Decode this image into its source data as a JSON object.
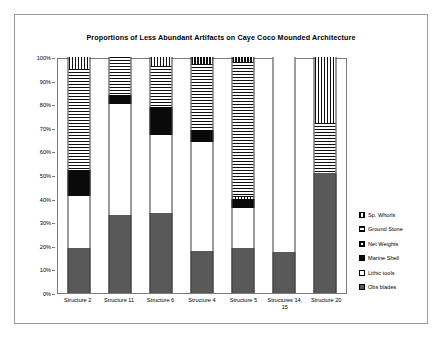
{
  "frame": {
    "border_color": "#9a9a9a"
  },
  "chart_data": {
    "type": "bar",
    "subtype": "stacked-100-percent",
    "title": "Proportions of Less Abundant Artifacts on Caye Coco Mounded Architecture",
    "xlabel": "",
    "ylabel": "",
    "ylim": [
      0,
      100
    ],
    "ytick_labels": [
      "100%",
      "90%",
      "80%",
      "70%",
      "60%",
      "50%",
      "40%",
      "30%",
      "20%",
      "10%",
      "0%"
    ],
    "ytick_values": [
      100,
      90,
      80,
      70,
      60,
      50,
      40,
      30,
      20,
      10,
      0
    ],
    "grid": false,
    "legend_position": "right",
    "categories": [
      "Structure 2",
      "Structure 11",
      "Structure 6",
      "Structure 4",
      "Structure 5",
      "Structures 14, 15",
      "Structure 20"
    ],
    "series": [
      {
        "name": "Sp. Whorls",
        "pattern": "vertical-stripe",
        "values": [
          5,
          0,
          4,
          3,
          2,
          0,
          28
        ]
      },
      {
        "name": "Ground Stone",
        "pattern": "horizontal-stripe",
        "values": [
          43,
          16,
          17,
          28,
          57,
          0,
          21
        ]
      },
      {
        "name": "Net Weights",
        "pattern": "net-grid",
        "values": [
          0,
          0,
          0,
          0,
          1,
          0,
          0
        ]
      },
      {
        "name": "Marine Shell",
        "pattern": "solid-black",
        "values": [
          11,
          4,
          12,
          5,
          4,
          0,
          0
        ]
      },
      {
        "name": "Lithic tools",
        "pattern": "solid-white",
        "values": [
          22,
          47,
          33,
          46,
          17,
          82.5,
          0
        ]
      },
      {
        "name": "Obs blades",
        "pattern": "solid-dark-gray",
        "values": [
          19,
          33,
          34,
          18,
          19,
          17.5,
          51
        ]
      }
    ],
    "stack_order_bottom_to_top": [
      "Obs blades",
      "Lithic tools",
      "Marine Shell",
      "Net Weights",
      "Ground Stone",
      "Sp. Whorls"
    ]
  }
}
